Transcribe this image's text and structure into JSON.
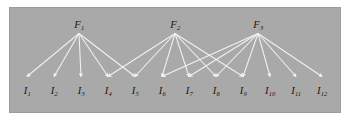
{
  "figure": {
    "type": "bipartite-factor-graph",
    "background_color": "#ffffff",
    "panel_color": "#a9a9a9",
    "edge_color": "#f2f2f2",
    "label_color": "#111111",
    "panel": {
      "x": 10,
      "y": 8,
      "width": 330,
      "height": 104
    }
  },
  "factors": [
    {
      "id": "F1",
      "label": "F",
      "sub": "1",
      "x": 79,
      "y": 29
    },
    {
      "id": "F2",
      "label": "F",
      "sub": "2",
      "x": 175,
      "y": 29
    },
    {
      "id": "F3",
      "label": "F",
      "sub": "3",
      "x": 258,
      "y": 29
    }
  ],
  "items": [
    {
      "id": "I1",
      "label": "I",
      "sub": "1",
      "x": 27,
      "y": 86
    },
    {
      "id": "I2",
      "label": "I",
      "sub": "2",
      "x": 54,
      "y": 86
    },
    {
      "id": "I3",
      "label": "I",
      "sub": "3",
      "x": 81,
      "y": 86
    },
    {
      "id": "I4",
      "label": "I",
      "sub": "4",
      "x": 108,
      "y": 86
    },
    {
      "id": "I5",
      "label": "I",
      "sub": "5",
      "x": 135,
      "y": 86
    },
    {
      "id": "I6",
      "label": "I",
      "sub": "6",
      "x": 162,
      "y": 86
    },
    {
      "id": "I7",
      "label": "I",
      "sub": "7",
      "x": 189,
      "y": 86
    },
    {
      "id": "I8",
      "label": "I",
      "sub": "8",
      "x": 216,
      "y": 86
    },
    {
      "id": "I9",
      "label": "I",
      "sub": "9",
      "x": 243,
      "y": 86
    },
    {
      "id": "I10",
      "label": "I",
      "sub": "10",
      "x": 270,
      "y": 86
    },
    {
      "id": "I11",
      "label": "I",
      "sub": "11",
      "x": 296,
      "y": 86
    },
    {
      "id": "I12",
      "label": "I",
      "sub": "12",
      "x": 322,
      "y": 86
    }
  ],
  "edges": [
    {
      "from": "F1",
      "to": "I1"
    },
    {
      "from": "F1",
      "to": "I2"
    },
    {
      "from": "F1",
      "to": "I3"
    },
    {
      "from": "F1",
      "to": "I4"
    },
    {
      "from": "F1",
      "to": "I5"
    },
    {
      "from": "F2",
      "to": "I4"
    },
    {
      "from": "F2",
      "to": "I5"
    },
    {
      "from": "F2",
      "to": "I6"
    },
    {
      "from": "F2",
      "to": "I7"
    },
    {
      "from": "F2",
      "to": "I8"
    },
    {
      "from": "F2",
      "to": "I9"
    },
    {
      "from": "F3",
      "to": "I6"
    },
    {
      "from": "F3",
      "to": "I7"
    },
    {
      "from": "F3",
      "to": "I8"
    },
    {
      "from": "F3",
      "to": "I9"
    },
    {
      "from": "F3",
      "to": "I10"
    },
    {
      "from": "F3",
      "to": "I11"
    },
    {
      "from": "F3",
      "to": "I12"
    }
  ]
}
